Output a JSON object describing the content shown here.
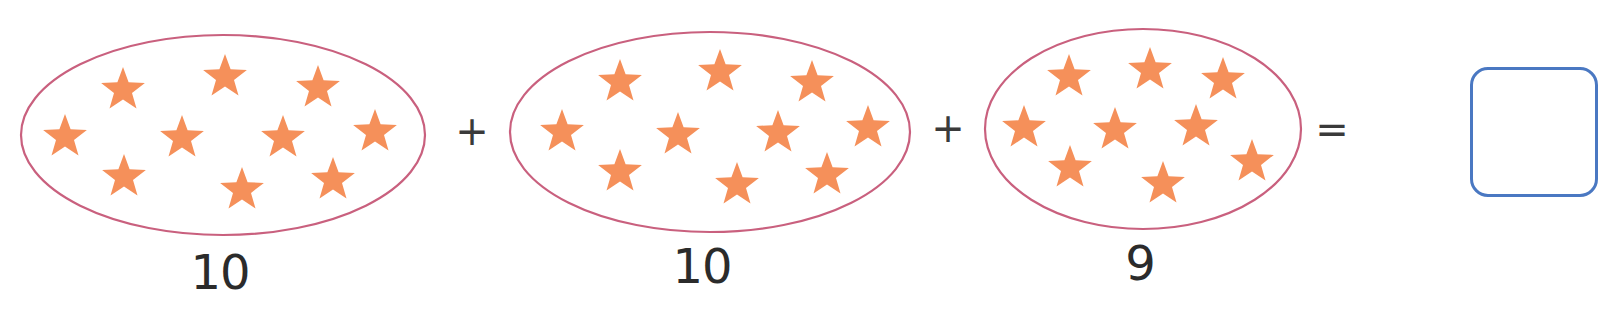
{
  "colors": {
    "ellipse_stroke": "#c9607e",
    "star_fill": "#f5905a",
    "text": "#2b2b2b",
    "operator": "#3a3a3a",
    "answer_box_border": "#4a78c2"
  },
  "equation": {
    "operators": [
      "+",
      "+",
      "="
    ],
    "answer": ""
  },
  "groups": [
    {
      "label": "10",
      "count": 10,
      "ellipse": {
        "cx": 223,
        "cy": 135,
        "rx": 202,
        "ry": 100
      },
      "label_pos": {
        "x": 220,
        "y": 272
      },
      "stars": [
        [
          123,
          90
        ],
        [
          225,
          77
        ],
        [
          318,
          88
        ],
        [
          65,
          137
        ],
        [
          182,
          138
        ],
        [
          283,
          138
        ],
        [
          375,
          132
        ],
        [
          124,
          177
        ],
        [
          242,
          190
        ],
        [
          333,
          180
        ]
      ]
    },
    {
      "label": "10",
      "count": 10,
      "ellipse": {
        "cx": 710,
        "cy": 132,
        "rx": 200,
        "ry": 100
      },
      "label_pos": {
        "x": 702,
        "y": 266
      },
      "stars": [
        [
          620,
          82
        ],
        [
          720,
          72
        ],
        [
          812,
          83
        ],
        [
          562,
          132
        ],
        [
          678,
          135
        ],
        [
          778,
          133
        ],
        [
          868,
          128
        ],
        [
          620,
          172
        ],
        [
          737,
          185
        ],
        [
          827,
          175
        ]
      ]
    },
    {
      "label": "9",
      "count": 9,
      "ellipse": {
        "cx": 1143,
        "cy": 129,
        "rx": 158,
        "ry": 100
      },
      "label_pos": {
        "x": 1140,
        "y": 263
      },
      "stars": [
        [
          1069,
          77
        ],
        [
          1150,
          70
        ],
        [
          1223,
          80
        ],
        [
          1024,
          128
        ],
        [
          1115,
          130
        ],
        [
          1196,
          127
        ],
        [
          1252,
          162
        ],
        [
          1070,
          168
        ],
        [
          1163,
          184
        ]
      ]
    }
  ],
  "operator_positions": [
    {
      "x": 472,
      "y": 131
    },
    {
      "x": 948,
      "y": 128
    },
    {
      "x": 1332,
      "y": 129
    }
  ],
  "answer_box": {
    "x": 1470,
    "y": 67,
    "w": 128,
    "h": 130
  }
}
